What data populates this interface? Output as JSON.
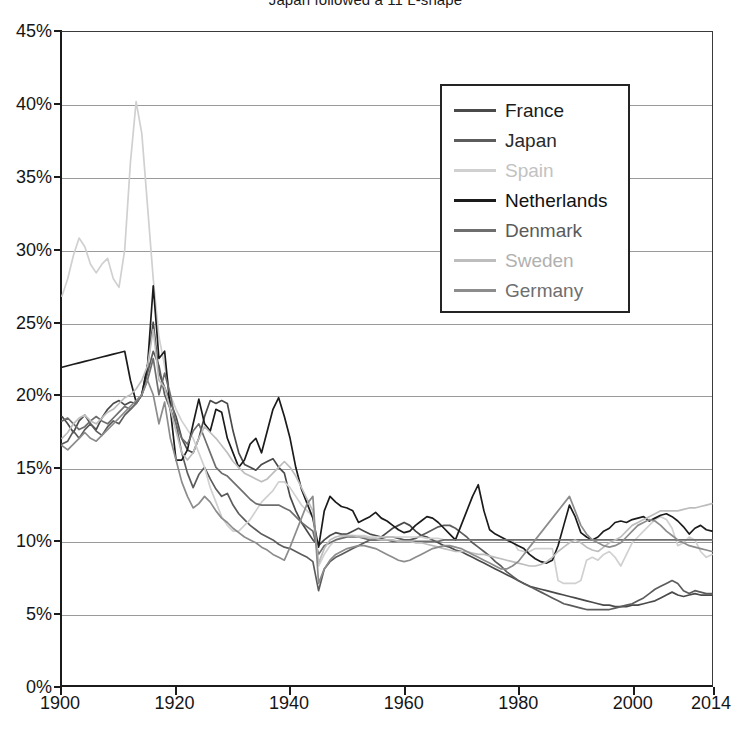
{
  "chart_data": {
    "type": "line",
    "title_raw": "Japan followed a 11 L-shape",
    "xlabel": "",
    "ylabel": "",
    "xlim": [
      1900,
      2014
    ],
    "ylim": [
      0,
      45
    ],
    "y_unit": "%",
    "grid": "horizontal",
    "legend_position": "top-right-inside",
    "x_tick_labels": [
      "1900",
      "1920",
      "1940",
      "1960",
      "1980",
      "2000",
      "2014"
    ],
    "x_tick_values": [
      1900,
      1920,
      1940,
      1960,
      1980,
      2000,
      2014
    ],
    "y_tick_labels": [
      "0%",
      "5%",
      "10%",
      "15%",
      "20%",
      "25%",
      "30%",
      "35%",
      "40%",
      "45%"
    ],
    "y_tick_values": [
      0,
      5,
      10,
      15,
      20,
      25,
      30,
      35,
      40,
      45
    ],
    "x_start": 1900,
    "series": [
      {
        "name": "France",
        "color": "#4a4a4a",
        "values": [
          18.5,
          18.0,
          17.4,
          18.2,
          18.6,
          18.0,
          17.6,
          18.4,
          19.0,
          19.4,
          19.6,
          19.3,
          19.5,
          19.4,
          20.0,
          22.0,
          25.0,
          21.5,
          20.5,
          19.5,
          18.5,
          17.0,
          16.2,
          16.0,
          17.0,
          18.5,
          19.6,
          19.4,
          19.6,
          19.4,
          17.5,
          16.0,
          15.2,
          15.0,
          14.8,
          15.2,
          15.4,
          15.6,
          15.0,
          14.6,
          13.0,
          12.0,
          11.2,
          10.6,
          10.0,
          9.6,
          10.0,
          10.3,
          10.5,
          10.4,
          10.4,
          10.6,
          10.8,
          10.6,
          10.4,
          10.3,
          10.2,
          10.5,
          10.8,
          11.0,
          11.2,
          11.0,
          10.6,
          10.3,
          10.2,
          10.0,
          9.8,
          9.6,
          9.5,
          9.3,
          9.2,
          9.0,
          8.8,
          8.6,
          8.4,
          8.2,
          8.0,
          7.8,
          7.6,
          7.4,
          7.2,
          7.0,
          6.8,
          6.7,
          6.6,
          6.5,
          6.4,
          6.3,
          6.2,
          6.1,
          6.0,
          5.9,
          5.8,
          5.7,
          5.6,
          5.5,
          5.5,
          5.4,
          5.4,
          5.4,
          5.5,
          5.5,
          5.6,
          5.7,
          5.8,
          6.0,
          6.2,
          6.4,
          6.2,
          6.1,
          6.2,
          6.3,
          6.2,
          6.2,
          6.2
        ]
      },
      {
        "name": "Japan",
        "color": "#5c5c5c",
        "values": [
          16.6,
          16.8,
          17.5,
          17.0,
          17.6,
          18.0,
          17.5,
          17.2,
          17.8,
          18.2,
          18.0,
          18.6,
          19.0,
          19.4,
          20.0,
          21.5,
          23.0,
          22.0,
          20.0,
          19.0,
          18.0,
          16.0,
          14.6,
          13.6,
          14.5,
          15.0,
          14.2,
          13.5,
          13.0,
          13.2,
          12.4,
          11.8,
          11.4,
          11.0,
          10.7,
          10.4,
          10.2,
          10.0,
          9.7,
          9.5,
          9.4,
          9.2,
          9.0,
          8.8,
          8.5,
          6.5,
          8.0,
          8.5,
          8.8,
          9.0,
          9.2,
          9.4,
          9.6,
          9.8,
          10.0,
          10.0,
          10.1,
          10.2,
          10.2,
          10.1,
          10.0,
          10.0,
          10.1,
          10.3,
          10.5,
          10.7,
          10.9,
          11.0,
          11.0,
          10.8,
          10.5,
          10.2,
          9.8,
          9.5,
          9.2,
          8.9,
          8.5,
          8.2,
          7.8,
          7.5,
          7.2,
          7.0,
          6.8,
          6.6,
          6.4,
          6.2,
          6.0,
          5.8,
          5.6,
          5.5,
          5.4,
          5.3,
          5.2,
          5.2,
          5.2,
          5.2,
          5.2,
          5.3,
          5.4,
          5.5,
          5.6,
          5.8,
          6.0,
          6.3,
          6.6,
          6.8,
          7.0,
          7.2,
          7.0,
          6.5,
          6.3,
          6.5,
          6.4,
          6.3,
          6.3
        ]
      },
      {
        "name": "Spain",
        "color": "#d0d0d0",
        "values": [
          26.8,
          28.0,
          29.6,
          30.8,
          30.2,
          29.0,
          28.4,
          29.0,
          29.4,
          28.0,
          27.4,
          30.0,
          36.0,
          40.2,
          38.0,
          33.0,
          28.0,
          24.0,
          22.0,
          20.0,
          19.0,
          18.2,
          17.6,
          17.0,
          16.0,
          15.0,
          13.6,
          12.6,
          11.6,
          11.0,
          10.6,
          10.6,
          11.0,
          11.4,
          12.0,
          12.6,
          13.0,
          13.4,
          14.0,
          14.0,
          13.6,
          13.0,
          12.4,
          12.0,
          11.6,
          8.2,
          9.0,
          9.6,
          10.0,
          10.2,
          10.3,
          10.3,
          10.3,
          10.3,
          10.2,
          10.2,
          10.2,
          10.2,
          10.2,
          10.2,
          10.2,
          10.2,
          10.2,
          10.2,
          10.1,
          10.1,
          10.1,
          10.0,
          10.0,
          10.0,
          10.0,
          10.0,
          10.0,
          10.0,
          10.0,
          10.0,
          10.0,
          10.0,
          10.0,
          10.0,
          9.3,
          9.2,
          9.2,
          9.4,
          9.4,
          9.4,
          9.4,
          7.2,
          7.0,
          7.0,
          7.0,
          7.2,
          8.6,
          8.8,
          8.6,
          9.0,
          9.2,
          8.8,
          8.2,
          9.0,
          9.8,
          10.2,
          10.6,
          11.0,
          11.4,
          11.6,
          11.4,
          10.8,
          9.6,
          9.8,
          10.2,
          10.0,
          9.2,
          8.8,
          9.0
        ]
      },
      {
        "name": "Netherlands",
        "color": "#1b1b1b",
        "values": [
          21.9,
          22.0,
          22.1,
          22.2,
          22.3,
          22.4,
          22.5,
          22.6,
          22.7,
          22.8,
          22.9,
          23.0,
          21.0,
          19.5,
          20.0,
          22.0,
          27.5,
          22.5,
          23.0,
          19.0,
          15.5,
          15.5,
          16.2,
          18.0,
          19.7,
          18.0,
          17.5,
          19.0,
          18.8,
          17.0,
          16.0,
          15.0,
          15.5,
          16.6,
          17.0,
          16.0,
          17.5,
          19.0,
          19.8,
          18.5,
          17.0,
          15.0,
          13.5,
          12.5,
          11.5,
          9.5,
          12.0,
          13.0,
          12.6,
          12.3,
          12.2,
          12.0,
          11.2,
          11.4,
          11.6,
          11.9,
          11.5,
          11.3,
          11.0,
          10.7,
          10.5,
          10.6,
          11.0,
          11.3,
          11.6,
          11.5,
          11.2,
          10.8,
          10.4,
          10.0,
          11.0,
          12.0,
          13.0,
          13.8,
          12.0,
          10.7,
          10.4,
          10.2,
          10.0,
          9.8,
          9.6,
          9.4,
          9.0,
          8.7,
          8.5,
          8.4,
          8.6,
          9.6,
          11.0,
          12.4,
          11.6,
          10.5,
          10.2,
          10.0,
          10.2,
          10.6,
          10.8,
          11.2,
          11.3,
          11.2,
          11.4,
          11.5,
          11.6,
          11.3,
          11.5,
          11.7,
          11.8,
          11.6,
          11.3,
          10.9,
          10.4,
          10.8,
          11.0,
          10.7,
          10.6
        ]
      },
      {
        "name": "Denmark",
        "color": "#6e6e6e",
        "values": [
          18.2,
          18.4,
          18.0,
          17.6,
          17.8,
          18.2,
          18.5,
          18.2,
          18.0,
          18.4,
          18.8,
          19.2,
          19.0,
          19.4,
          20.0,
          21.0,
          22.5,
          20.0,
          21.5,
          20.0,
          18.0,
          17.0,
          16.6,
          17.5,
          18.0,
          17.0,
          16.0,
          15.0,
          14.6,
          14.4,
          14.0,
          13.6,
          13.2,
          12.8,
          12.5,
          12.4,
          12.4,
          12.4,
          12.4,
          12.2,
          12.0,
          11.6,
          11.2,
          10.9,
          10.6,
          9.0,
          9.6,
          9.8,
          10.0,
          10.1,
          10.2,
          10.2,
          10.2,
          10.1,
          10.0,
          10.0,
          10.0,
          10.0,
          9.9,
          9.9,
          9.9,
          9.9,
          9.9,
          9.9,
          9.9,
          9.9,
          9.9,
          10.0,
          10.0,
          10.0,
          10.0,
          10.0,
          10.0,
          10.0,
          10.0,
          10.0,
          10.0,
          10.0,
          10.0,
          10.0,
          10.0,
          10.0,
          10.0,
          10.0,
          10.0,
          10.0,
          10.0,
          10.0,
          10.0,
          10.0,
          10.0,
          10.0,
          10.0,
          10.0,
          10.0,
          10.0,
          10.0,
          10.0,
          10.0,
          10.0,
          10.0,
          10.0,
          10.0,
          10.0,
          10.0,
          10.0,
          10.0,
          10.0,
          10.0,
          10.0,
          10.0,
          10.0,
          10.0,
          10.0,
          10.0
        ]
      },
      {
        "name": "Sweden",
        "color": "#bdbdbd",
        "values": [
          17.0,
          17.4,
          18.0,
          18.4,
          18.6,
          18.2,
          18.0,
          18.4,
          18.8,
          19.0,
          19.4,
          19.8,
          20.0,
          20.4,
          21.0,
          22.0,
          24.5,
          21.0,
          20.5,
          19.0,
          17.5,
          16.0,
          15.5,
          16.0,
          17.0,
          17.8,
          17.4,
          17.0,
          16.5,
          16.0,
          15.4,
          15.0,
          14.6,
          14.4,
          14.2,
          14.0,
          14.2,
          14.6,
          15.0,
          15.4,
          15.0,
          14.4,
          13.6,
          12.8,
          12.0,
          8.4,
          9.4,
          10.0,
          10.2,
          10.3,
          10.3,
          10.3,
          10.2,
          10.2,
          10.1,
          10.1,
          10.0,
          10.0,
          10.0,
          9.9,
          9.9,
          9.9,
          9.8,
          9.8,
          9.7,
          9.6,
          9.5,
          9.4,
          9.3,
          9.2,
          9.2,
          9.2,
          9.1,
          9.0,
          9.0,
          8.9,
          8.8,
          8.7,
          8.6,
          8.5,
          8.4,
          8.3,
          8.2,
          8.2,
          8.3,
          8.5,
          8.8,
          9.2,
          9.5,
          9.8,
          10.0,
          9.8,
          9.5,
          9.3,
          9.2,
          9.5,
          9.8,
          10.0,
          10.2,
          10.6,
          11.0,
          11.2,
          11.4,
          11.6,
          11.8,
          12.0,
          12.0,
          12.0,
          12.0,
          12.1,
          12.2,
          12.2,
          12.3,
          12.4,
          12.5
        ]
      },
      {
        "name": "Germany",
        "color": "#8c8c8c",
        "values": [
          16.5,
          16.2,
          16.6,
          17.0,
          17.4,
          17.0,
          16.8,
          17.2,
          17.6,
          18.0,
          18.4,
          18.8,
          19.2,
          19.6,
          20.0,
          21.0,
          20.0,
          18.0,
          19.5,
          17.0,
          15.5,
          14.0,
          13.0,
          12.2,
          12.5,
          13.0,
          12.6,
          12.0,
          11.5,
          11.2,
          10.8,
          10.5,
          10.2,
          10.0,
          9.8,
          9.5,
          9.3,
          9.0,
          8.8,
          8.6,
          9.5,
          10.5,
          11.5,
          12.5,
          13.0,
          7.0,
          8.0,
          8.6,
          9.0,
          9.2,
          9.4,
          9.5,
          9.6,
          9.6,
          9.5,
          9.4,
          9.2,
          9.0,
          8.8,
          8.6,
          8.5,
          8.6,
          8.8,
          9.0,
          9.2,
          9.4,
          9.5,
          9.6,
          9.6,
          9.5,
          9.4,
          9.2,
          9.0,
          8.8,
          8.6,
          8.4,
          8.2,
          8.0,
          8.0,
          8.2,
          8.5,
          9.0,
          9.5,
          10.0,
          10.5,
          11.0,
          11.5,
          12.0,
          12.5,
          13.0,
          12.0,
          11.0,
          10.4,
          10.0,
          9.8,
          9.6,
          9.5,
          9.6,
          9.8,
          10.2,
          10.6,
          11.0,
          11.2,
          11.4,
          11.3,
          11.0,
          10.6,
          10.3,
          10.0,
          9.8,
          9.6,
          9.5,
          9.4,
          9.3,
          9.2
        ]
      }
    ]
  },
  "legend": {
    "items": [
      {
        "label": "France",
        "color": "#4a4a4a",
        "text_color": "#1b1b1b"
      },
      {
        "label": "Japan",
        "color": "#5c5c5c",
        "text_color": "#2a2a2a"
      },
      {
        "label": "Spain",
        "color": "#d0d0d0",
        "text_color": "#c2c2c2"
      },
      {
        "label": "Netherlands",
        "color": "#1b1b1b",
        "text_color": "#111111"
      },
      {
        "label": "Denmark",
        "color": "#6e6e6e",
        "text_color": "#5a5a5a"
      },
      {
        "label": "Sweden",
        "color": "#bdbdbd",
        "text_color": "#b0b0b0"
      },
      {
        "label": "Germany",
        "color": "#8c8c8c",
        "text_color": "#6e6e6e"
      }
    ]
  },
  "axis_colors": {
    "axis_line": "#1b1b1b",
    "gridline": "#9a9a9a",
    "tick_text": "#151515"
  }
}
